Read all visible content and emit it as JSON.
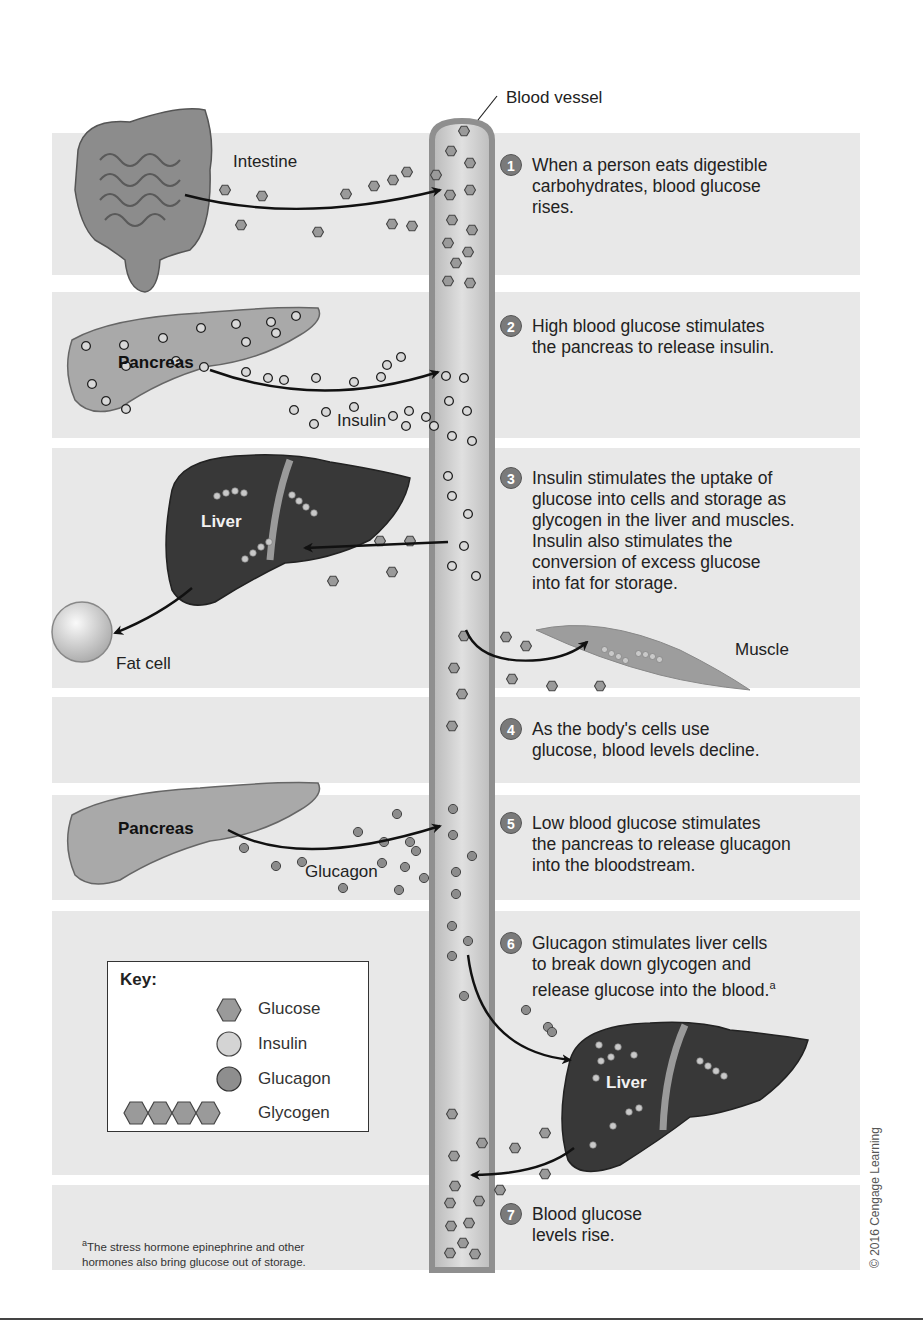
{
  "diagram": {
    "vessel_label": "Blood vessel",
    "organs": {
      "intestine": "Intestine",
      "pancreas_top": "Pancreas",
      "insulin": "Insulin",
      "liver_top": "Liver",
      "fat_cell": "Fat cell",
      "muscle": "Muscle",
      "pancreas_bottom": "Pancreas",
      "glucagon": "Glucagon",
      "liver_bottom": "Liver"
    },
    "steps": [
      {
        "num": "1",
        "text": "When a person eats digestible\ncarbohydrates, blood glucose\nrises."
      },
      {
        "num": "2",
        "text": "High blood glucose stimulates\nthe pancreas to release insulin."
      },
      {
        "num": "3",
        "text": "Insulin stimulates the uptake of\nglucose into cells and storage as\nglycogen in the liver and muscles.\nInsulin also stimulates the\nconversion of excess glucose\ninto fat for storage."
      },
      {
        "num": "4",
        "text": "As the body's cells use\nglucose, blood levels decline."
      },
      {
        "num": "5",
        "text": "Low blood glucose stimulates\nthe pancreas to release glucagon\ninto the bloodstream."
      },
      {
        "num": "6",
        "text": "Glucagon stimulates liver cells\nto break down glycogen and\nrelease glucose into the blood.",
        "footnote_mark": "a"
      },
      {
        "num": "7",
        "text": "Blood glucose\nlevels rise."
      }
    ],
    "key": {
      "title": "Key:",
      "items": [
        {
          "label": "Glucose",
          "icon": "hexagon-icon"
        },
        {
          "label": "Insulin",
          "icon": "light-circle-icon"
        },
        {
          "label": "Glucagon",
          "icon": "dark-circle-icon"
        },
        {
          "label": "Glycogen",
          "icon": "hexagon-chain-icon"
        }
      ]
    },
    "footnote": {
      "mark": "a",
      "text": "The stress hormone epinephrine and other\nhormones also bring glucose out of storage."
    },
    "copyright": "© 2016 Cengage Learning",
    "colors": {
      "band": "#e8e8e8",
      "vessel_wall": "#8f8f8f",
      "vessel_fill": "#cfcfcf",
      "organ_dark": "#3a3a3a",
      "pancreas": "#a9a9a9",
      "glucose": "#9a9a9a",
      "insulin": "#d0d0d0",
      "glucagon": "#8a8a8a",
      "step_badge": "#7a7a7a"
    }
  }
}
